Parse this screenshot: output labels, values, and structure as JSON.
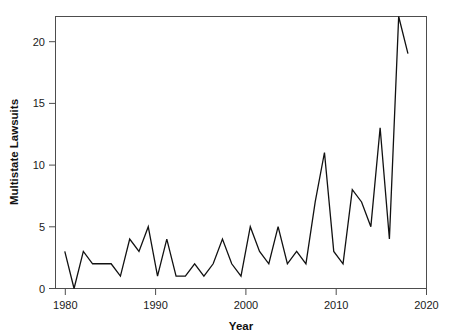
{
  "chart_data": {
    "type": "line",
    "title": "",
    "xlabel": "Year",
    "ylabel": "Multistate Lawsuits",
    "xlim": [
      1980,
      2020
    ],
    "ylim": [
      0,
      22
    ],
    "grid": false,
    "legend": null,
    "xticks": [
      1980,
      1990,
      2000,
      2010,
      2020
    ],
    "xtick_labels": [
      "1980",
      "1990",
      "2000",
      "2010",
      "2020"
    ],
    "yticks": [
      0,
      5,
      10,
      15,
      20
    ],
    "ytick_labels": [
      "0",
      "5",
      "10",
      "15",
      "20"
    ],
    "line_color": "#111111",
    "x": [
      1981,
      1982,
      1983,
      1984,
      1985,
      1986,
      1987,
      1988,
      1989,
      1990,
      1991,
      1992,
      1993,
      1994,
      1995,
      1996,
      1997,
      1998,
      1999,
      2000,
      2001,
      2002,
      2003,
      2004,
      2005,
      2006,
      2007,
      2008,
      2009,
      2010,
      2011,
      2012,
      2013,
      2014,
      2015,
      2016,
      2017,
      2018
    ],
    "values": [
      3,
      0,
      3,
      2,
      2,
      2,
      1,
      4,
      3,
      5,
      1,
      4,
      1,
      1,
      2,
      1,
      2,
      4,
      2,
      1,
      5,
      3,
      2,
      5,
      2,
      3,
      2,
      7,
      11,
      3,
      2,
      8,
      7,
      5,
      13,
      4,
      22,
      19
    ],
    "series": [
      {
        "name": "Multistate Lawsuits",
        "values": [
          3,
          0,
          3,
          2,
          2,
          2,
          1,
          4,
          3,
          5,
          1,
          4,
          1,
          1,
          2,
          1,
          2,
          4,
          2,
          1,
          5,
          3,
          2,
          5,
          2,
          3,
          2,
          7,
          11,
          3,
          2,
          8,
          7,
          5,
          13,
          4,
          22,
          19
        ]
      }
    ]
  },
  "axes": {
    "x_title": "Year",
    "y_title": "Multistate Lawsuits"
  }
}
